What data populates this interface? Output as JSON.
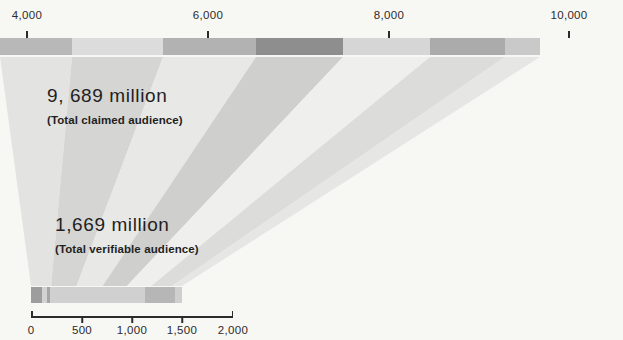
{
  "chart_data": {
    "type": "bar",
    "title": "",
    "subtitle": "",
    "xlabel": "",
    "ylabel": "",
    "background_color": "#f7f7f4",
    "annotations": [
      {
        "value_label": "9, 689 million",
        "caption": "(Total claimed audience)",
        "value": 9689,
        "unit": "million"
      },
      {
        "value_label": "1,669 million",
        "caption": "(Total verifiable audience)",
        "value": 1669,
        "unit": "million"
      }
    ],
    "top_axis": {
      "name": "claimed-audience-axis",
      "ticks": [
        4000,
        6000,
        8000,
        10000
      ],
      "tick_labels": [
        "4,000",
        "6,000",
        "8,000",
        "10,000"
      ],
      "range": [
        3700,
        10000
      ],
      "grid": false
    },
    "bottom_axis": {
      "name": "verifiable-audience-axis",
      "ticks": [
        0,
        500,
        1000,
        1500,
        2000
      ],
      "tick_labels": [
        "0",
        "500",
        "1,000",
        "1,500",
        "2,000"
      ],
      "range": [
        0,
        2000
      ],
      "grid": false
    },
    "top_bar": {
      "name": "total-claimed-audience-bar",
      "total": 9689,
      "segments": [
        {
          "width_px": 72,
          "color": "#b8b8b8"
        },
        {
          "width_px": 91,
          "color": "#dcdcdc"
        },
        {
          "width_px": 93,
          "color": "#b2b2b2"
        },
        {
          "width_px": 87,
          "color": "#8e8e8e"
        },
        {
          "width_px": 87,
          "color": "#d6d6d6"
        },
        {
          "width_px": 75,
          "color": "#ababab"
        },
        {
          "width_px": 35,
          "color": "#c9c9c9"
        }
      ]
    },
    "bottom_bar": {
      "name": "total-verifiable-audience-bar",
      "total": 1669,
      "segments": [
        {
          "width_px": 11,
          "color": "#9d9d9d"
        },
        {
          "width_px": 5,
          "color": "#d2d2d2"
        },
        {
          "width_px": 3,
          "color": "#a6a6a6"
        },
        {
          "width_px": 95,
          "color": "#d0d0d0"
        },
        {
          "width_px": 30,
          "color": "#b6b6b6"
        },
        {
          "width_px": 7,
          "color": "#cfcfcf"
        }
      ]
    },
    "funnel_ribbons": [
      {
        "color": "#e3e3e1"
      },
      {
        "color": "#d5d5d3"
      },
      {
        "color": "#e8e8e6"
      },
      {
        "color": "#cfcfcd"
      },
      {
        "color": "#efefed"
      },
      {
        "color": "#dcdcda"
      },
      {
        "color": "#e6e6e4"
      }
    ]
  },
  "colors": {
    "text": "#1f1f1f",
    "axis": "#2b2b2b",
    "background": "#f7f7f4"
  }
}
